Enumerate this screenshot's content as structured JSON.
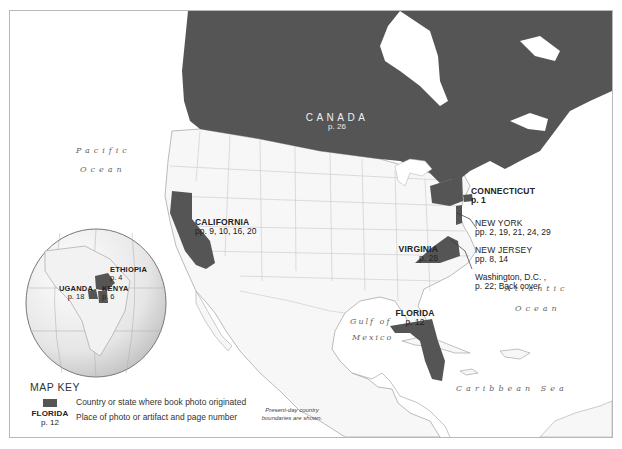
{
  "map": {
    "colors": {
      "highlight": "#555555",
      "land": "#f7f7f7",
      "border": "#bbbbbb",
      "water": "#ffffff",
      "frame": "#b8b8b8"
    },
    "oceans": {
      "pacific_line1": "Pacific",
      "pacific_line2": "Ocean",
      "atlantic_line1": "Atlantic",
      "atlantic_line2": "Ocean",
      "gulf_line1": "Gulf of",
      "gulf_line2": "Mexico",
      "caribbean": "Caribbean Sea"
    },
    "places": {
      "canada": {
        "name": "CANADA",
        "pages": "p. 26"
      },
      "california": {
        "name": "CALIFORNIA",
        "pages": "pp. 9, 10, 16, 20"
      },
      "connecticut": {
        "name": "CONNECTICUT",
        "pages": "p. 1"
      },
      "new_york": {
        "name": "NEW YORK",
        "pages": "pp. 2, 19, 21, 24, 29"
      },
      "new_jersey": {
        "name": "NEW JERSEY",
        "pages": "pp. 8, 14"
      },
      "washington_dc": {
        "name": "Washington, D.C. ,",
        "pages": "p. 22; Back cover"
      },
      "virginia": {
        "name": "VIRGINIA",
        "pages": "p. 28"
      },
      "florida": {
        "name": "FLORIDA",
        "pages": "p. 12"
      },
      "ethiopia": {
        "name": "ETHIOPIA",
        "pages": "p. 4"
      },
      "uganda": {
        "name": "UGANDA",
        "pages": "p. 18"
      },
      "kenya": {
        "name": "KENYA",
        "pages": "p. 6"
      }
    },
    "key": {
      "title": "MAP KEY",
      "swatch_desc": "Country or state where book photo originated",
      "example_name": "FLORIDA",
      "example_page": "p. 12",
      "example_desc": "Place of photo or artifact and page number"
    },
    "note_line1": "Present-day country",
    "note_line2": "boundaries are shown."
  }
}
